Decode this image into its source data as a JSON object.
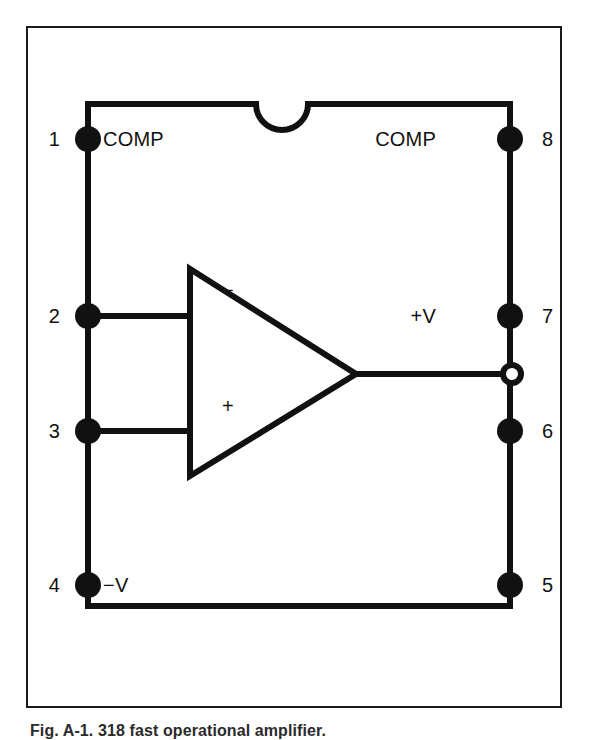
{
  "figure": {
    "caption": "Fig. A-1. 318 fast operational amplifier.",
    "device_type": "8-pin DIP operational amplifier pinout diagram",
    "notch_marker": "semicircular notch on top edge",
    "line_color": "#111111",
    "background_color": "#ffffff"
  },
  "pins": {
    "left": [
      {
        "number": "1",
        "label": "COMP"
      },
      {
        "number": "2",
        "label": ""
      },
      {
        "number": "3",
        "label": ""
      },
      {
        "number": "4",
        "label": "−V"
      }
    ],
    "right": [
      {
        "number": "8",
        "label": "COMP"
      },
      {
        "number": "7",
        "label": "+V"
      },
      {
        "number": "6",
        "label": ""
      },
      {
        "number": "5",
        "label": ""
      }
    ]
  },
  "amplifier": {
    "symbol": "triangle",
    "orientation": "right",
    "inverting_input_sign": "−",
    "noninverting_input_sign": "+",
    "output_terminal": "open-circle"
  }
}
